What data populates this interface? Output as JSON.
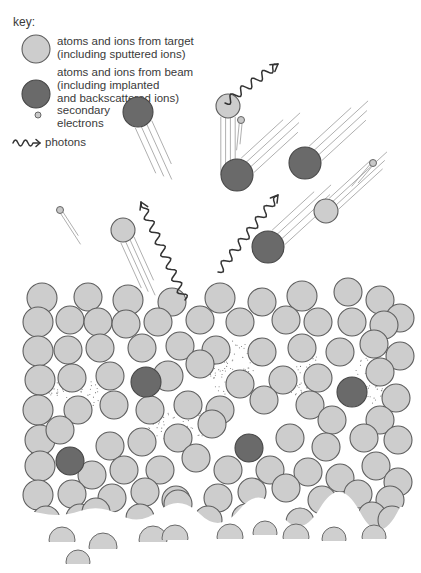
{
  "key": {
    "title": "key:",
    "items": [
      {
        "type": "target",
        "line1": "atoms and ions from target",
        "line2": "(including sputtered ions)",
        "line3": ""
      },
      {
        "type": "beam",
        "line1": "atoms and ions from beam",
        "line2": "(including implanted",
        "line3": "and backscattered ions)"
      },
      {
        "type": "electron",
        "line1": "secondary",
        "line2": "electrons",
        "line3": ""
      },
      {
        "type": "photon",
        "line1": "photons",
        "line2": "",
        "line3": ""
      }
    ]
  },
  "colors": {
    "target_fill": "#cdcdcd",
    "beam_fill": "#6a6a6a",
    "outline": "#5e5e5e",
    "photon": "#333333"
  },
  "flying_particles": [
    {
      "type": "beam",
      "cx": 138,
      "cy": 112,
      "r": 15,
      "streak_dx": 28,
      "streak_dy": 62
    },
    {
      "type": "target",
      "cx": 228,
      "cy": 106,
      "r": 12,
      "streak_dx": 0,
      "streak_dy": 80
    },
    {
      "type": "beam",
      "cx": 237,
      "cy": 175,
      "r": 16,
      "streak_dx": 60,
      "streak_dy": -55
    },
    {
      "type": "beam",
      "cx": 305,
      "cy": 163,
      "r": 16,
      "streak_dx": 60,
      "streak_dy": -55
    },
    {
      "type": "target",
      "cx": 326,
      "cy": 211,
      "r": 12,
      "streak_dx": 60,
      "streak_dy": -55
    },
    {
      "type": "beam",
      "cx": 268,
      "cy": 247,
      "r": 16,
      "streak_dx": 60,
      "streak_dy": -55
    },
    {
      "type": "target",
      "cx": 123,
      "cy": 230,
      "r": 12,
      "streak_dx": 28,
      "streak_dy": 62
    },
    {
      "type": "electron",
      "cx": 241,
      "cy": 120,
      "r": 3.5,
      "streak_dx": -3,
      "streak_dy": 30
    },
    {
      "type": "electron",
      "cx": 373,
      "cy": 163,
      "r": 3.5,
      "streak_dx": -20,
      "streak_dy": 24
    },
    {
      "type": "electron",
      "cx": 60,
      "cy": 210,
      "r": 3.5,
      "streak_dx": 22,
      "streak_dy": 34
    }
  ],
  "photons": [
    {
      "x1": 225,
      "y1": 103,
      "x2": 278,
      "y2": 64
    },
    {
      "x1": 218,
      "y1": 272,
      "x2": 278,
      "y2": 195
    },
    {
      "x1": 185,
      "y1": 300,
      "x2": 141,
      "y2": 202
    }
  ],
  "lattice": {
    "target_atoms": [
      [
        42,
        298,
        15
      ],
      [
        88,
        297,
        14
      ],
      [
        128,
        300,
        15
      ],
      [
        172,
        302,
        14
      ],
      [
        220,
        298,
        15
      ],
      [
        262,
        302,
        14
      ],
      [
        302,
        296,
        15
      ],
      [
        348,
        292,
        14
      ],
      [
        380,
        300,
        14
      ],
      [
        400,
        318,
        14
      ],
      [
        38,
        322,
        15
      ],
      [
        70,
        320,
        14
      ],
      [
        98,
        322,
        14
      ],
      [
        126,
        324,
        14
      ],
      [
        158,
        322,
        14
      ],
      [
        200,
        320,
        14
      ],
      [
        240,
        322,
        14
      ],
      [
        286,
        320,
        14
      ],
      [
        318,
        322,
        14
      ],
      [
        352,
        322,
        14
      ],
      [
        384,
        325,
        14
      ],
      [
        38,
        351,
        15
      ],
      [
        68,
        350,
        14
      ],
      [
        100,
        348,
        14
      ],
      [
        142,
        348,
        14
      ],
      [
        180,
        346,
        14
      ],
      [
        216,
        350,
        14
      ],
      [
        262,
        352,
        14
      ],
      [
        302,
        348,
        14
      ],
      [
        340,
        352,
        14
      ],
      [
        374,
        344,
        14
      ],
      [
        400,
        356,
        14
      ],
      [
        40,
        380,
        15
      ],
      [
        72,
        378,
        14
      ],
      [
        110,
        376,
        14
      ],
      [
        168,
        376,
        15
      ],
      [
        200,
        364,
        14
      ],
      [
        240,
        384,
        14
      ],
      [
        283,
        380,
        14
      ],
      [
        318,
        378,
        14
      ],
      [
        380,
        372,
        14
      ],
      [
        396,
        398,
        14
      ],
      [
        38,
        410,
        15
      ],
      [
        78,
        410,
        14
      ],
      [
        114,
        405,
        14
      ],
      [
        150,
        410,
        14
      ],
      [
        188,
        405,
        14
      ],
      [
        220,
        410,
        14
      ],
      [
        264,
        400,
        14
      ],
      [
        310,
        405,
        14
      ],
      [
        332,
        420,
        14
      ],
      [
        380,
        420,
        14
      ],
      [
        40,
        440,
        15
      ],
      [
        60,
        430,
        14
      ],
      [
        110,
        446,
        14
      ],
      [
        142,
        442,
        14
      ],
      [
        178,
        438,
        14
      ],
      [
        212,
        424,
        14
      ],
      [
        290,
        438,
        14
      ],
      [
        326,
        447,
        14
      ],
      [
        364,
        438,
        14
      ],
      [
        398,
        440,
        14
      ],
      [
        40,
        466,
        15
      ],
      [
        92,
        475,
        14
      ],
      [
        124,
        470,
        14
      ],
      [
        160,
        470,
        14
      ],
      [
        196,
        458,
        14
      ],
      [
        228,
        470,
        14
      ],
      [
        270,
        470,
        14
      ],
      [
        308,
        472,
        14
      ],
      [
        340,
        478,
        14
      ],
      [
        376,
        466,
        14
      ],
      [
        398,
        482,
        14
      ],
      [
        38,
        495,
        15
      ],
      [
        72,
        494,
        14
      ],
      [
        112,
        498,
        14
      ],
      [
        145,
        492,
        14
      ],
      [
        176,
        500,
        14
      ],
      [
        218,
        498,
        14
      ],
      [
        252,
        492,
        14
      ],
      [
        286,
        488,
        14
      ],
      [
        322,
        500,
        14
      ],
      [
        358,
        494,
        14
      ],
      [
        390,
        500,
        14
      ],
      [
        46,
        520,
        14
      ],
      [
        80,
        518,
        14
      ],
      [
        96,
        512,
        14
      ],
      [
        140,
        518,
        14
      ],
      [
        178,
        504,
        14
      ],
      [
        208,
        520,
        14
      ],
      [
        246,
        518,
        14
      ],
      [
        300,
        522,
        14
      ],
      [
        336,
        518,
        14
      ],
      [
        372,
        516,
        14
      ],
      [
        392,
        520,
        14
      ]
    ],
    "beam_atoms": [
      [
        146,
        382,
        15
      ],
      [
        352,
        392,
        15
      ],
      [
        249,
        448,
        14
      ],
      [
        70,
        461,
        14
      ]
    ],
    "vacancy_regions": [
      {
        "cx": 78,
        "cy": 388,
        "rx": 32,
        "ry": 20
      },
      {
        "cx": 180,
        "cy": 424,
        "rx": 32,
        "ry": 18
      },
      {
        "cx": 232,
        "cy": 368,
        "rx": 24,
        "ry": 28
      },
      {
        "cx": 306,
        "cy": 378,
        "rx": 22,
        "ry": 24
      },
      {
        "cx": 370,
        "cy": 380,
        "rx": 18,
        "ry": 24
      }
    ],
    "faded_bottom_atoms": [
      [
        62,
        540,
        13
      ],
      [
        103,
        547,
        14
      ],
      [
        78,
        562,
        12
      ],
      [
        153,
        540,
        14
      ],
      [
        175,
        538,
        13
      ],
      [
        230,
        537,
        13
      ],
      [
        265,
        533,
        12
      ],
      [
        296,
        537,
        13
      ],
      [
        334,
        539,
        12
      ],
      [
        374,
        537,
        12
      ]
    ]
  }
}
